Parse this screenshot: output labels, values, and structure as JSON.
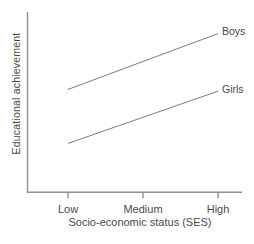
{
  "figure": {
    "background_color": "#ffffff"
  },
  "chart_data": {
    "type": "line",
    "title": "",
    "xlabel": "Socio-economic status (SES)",
    "ylabel": "Educational achievement",
    "categories": [
      "Low",
      "Medium",
      "High"
    ],
    "series": [
      {
        "name": "Boys",
        "values": [
          57,
          72.5,
          88
        ]
      },
      {
        "name": "Girls",
        "values": [
          27,
          41.5,
          56
        ]
      }
    ],
    "ylim": [
      0,
      100
    ],
    "y_ticks_shown": false,
    "grid": false,
    "legend_position": "line-end-right",
    "line_color": "#7d7d7d",
    "axis_color": "#909090",
    "text_color": "#4a4a4a"
  }
}
